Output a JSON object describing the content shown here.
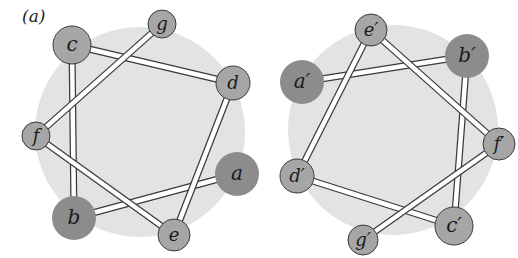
{
  "panel_label": "(a)",
  "colors": {
    "background_disk": "#e3e3e3",
    "node_large_fill": "#8c8c8c",
    "node_small_fill": "#a6a6a6",
    "node_stroke": "#3a3a3a",
    "bond_fill": "#ffffff",
    "bond_stroke": "#3a3a3a"
  },
  "wheels": [
    {
      "name": "left-wheel",
      "disk": {
        "cx": 140,
        "cy": 132,
        "r": 105
      },
      "nodes": [
        {
          "id": "a",
          "label": "a",
          "cx": 237,
          "cy": 174,
          "r": 22,
          "size": "large"
        },
        {
          "id": "b",
          "label": "b",
          "cx": 74,
          "cy": 218,
          "r": 22,
          "size": "large"
        },
        {
          "id": "c",
          "label": "c",
          "cx": 72,
          "cy": 45,
          "r": 19,
          "size": "medium"
        },
        {
          "id": "d",
          "label": "d",
          "cx": 233,
          "cy": 83,
          "r": 17,
          "size": "medium"
        },
        {
          "id": "e",
          "label": "e",
          "cx": 174,
          "cy": 235,
          "r": 16,
          "size": "small"
        },
        {
          "id": "f",
          "label": "f",
          "cx": 36,
          "cy": 136,
          "r": 14,
          "size": "small"
        },
        {
          "id": "g",
          "label": "g",
          "cx": 162,
          "cy": 24,
          "r": 14,
          "size": "small"
        }
      ],
      "bonds": [
        [
          "a",
          "b"
        ],
        [
          "b",
          "c"
        ],
        [
          "c",
          "d"
        ],
        [
          "d",
          "e"
        ],
        [
          "e",
          "f"
        ],
        [
          "f",
          "g"
        ]
      ]
    },
    {
      "name": "right-wheel",
      "disk": {
        "cx": 393,
        "cy": 130,
        "r": 105
      },
      "nodes": [
        {
          "id": "a'",
          "label": "a′",
          "cx": 302,
          "cy": 82,
          "r": 22,
          "size": "large"
        },
        {
          "id": "b'",
          "label": "b′",
          "cx": 467,
          "cy": 56,
          "r": 22,
          "size": "large"
        },
        {
          "id": "c'",
          "label": "c′",
          "cx": 454,
          "cy": 226,
          "r": 19,
          "size": "medium"
        },
        {
          "id": "d'",
          "label": "d′",
          "cx": 297,
          "cy": 176,
          "r": 17,
          "size": "medium"
        },
        {
          "id": "e'",
          "label": "e′",
          "cx": 371,
          "cy": 30,
          "r": 16,
          "size": "small"
        },
        {
          "id": "f'",
          "label": "f′",
          "cx": 499,
          "cy": 144,
          "r": 16,
          "size": "small"
        },
        {
          "id": "g'",
          "label": "g′",
          "cx": 363,
          "cy": 240,
          "r": 15,
          "size": "small"
        }
      ],
      "bonds": [
        [
          "a'",
          "b'"
        ],
        [
          "b'",
          "c'"
        ],
        [
          "c'",
          "d'"
        ],
        [
          "d'",
          "e'"
        ],
        [
          "e'",
          "f'"
        ],
        [
          "f'",
          "g'"
        ]
      ]
    }
  ]
}
